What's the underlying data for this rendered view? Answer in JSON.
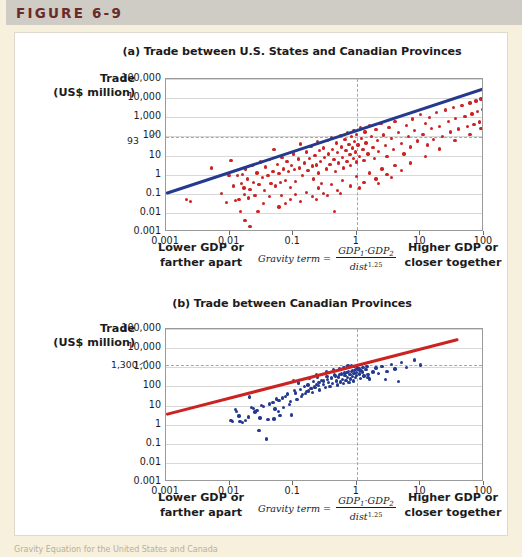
{
  "figure": {
    "label": "FIGURE 6-9",
    "bottom_caption": "Gravity Equation for the United States and Canada"
  },
  "colors": {
    "figure_label": "#6b2a2a",
    "top_band": "#cfccc6",
    "page_background": "#f6f0dc",
    "panel_background": "#ffffff",
    "panel_a_points": "#cc2222",
    "panel_a_line": "#243a8f",
    "panel_b_points": "#243a8f",
    "panel_b_line": "#cc2222",
    "gridline": "#d8d8d8",
    "dashed_guide": "#a6a6a6",
    "axis": "#9a9a9a"
  },
  "axis_titles": {
    "y_line1": "Trade",
    "y_line2": "(US$ million)"
  },
  "footer": {
    "lower_line1": "Lower GDP or",
    "lower_line2": "farther apart",
    "higher_line1": "Higher GDP or",
    "higher_line2": "closer together",
    "gravity_label": "Gravity term",
    "gravity_equals": "=",
    "gravity_num_gdp1": "GDP",
    "gravity_num_sub1": "1",
    "gravity_num_dot": "·",
    "gravity_num_gdp2": "GDP",
    "gravity_num_sub2": "2",
    "gravity_den_dist": "dist",
    "gravity_den_exp": "1.25"
  },
  "chart_data": [
    {
      "type": "scatter",
      "panel": "a",
      "title": "(a) Trade between U.S. States and Canadian Provinces",
      "xlabel": "Gravity term",
      "ylabel": "Trade (US$ million)",
      "xscale": "log",
      "yscale": "log",
      "xlim": [
        0.001,
        100
      ],
      "ylim": [
        0.001,
        100000
      ],
      "xticks": [
        "0.001",
        "0.01",
        "0.1",
        "1",
        "10",
        "100"
      ],
      "yticks": [
        "0.001",
        "0.01",
        "0.1",
        "1",
        "10",
        "100",
        "1,000",
        "10,000",
        "100,000"
      ],
      "grid": true,
      "legend": "none",
      "point_color": "#cc2222",
      "line_color": "#243a8f",
      "annotation_y_value": "93",
      "annotation_y_numeric": 93,
      "guide_vline_x": 1,
      "fit_line": {
        "x1": 0.001,
        "y1": 0.1,
        "x2": 100,
        "y2": 30000
      },
      "points": [
        [
          0.0021,
          0.05
        ],
        [
          0.0024,
          0.04
        ],
        [
          0.0052,
          2.2
        ],
        [
          0.0074,
          0.1
        ],
        [
          0.0098,
          0.9
        ],
        [
          0.0105,
          5.5
        ],
        [
          0.0115,
          0.25
        ],
        [
          0.0125,
          0.045
        ],
        [
          0.0132,
          0.9
        ],
        [
          0.014,
          0.05
        ],
        [
          0.0148,
          0.012
        ],
        [
          0.0152,
          0.34
        ],
        [
          0.016,
          1.0
        ],
        [
          0.0168,
          0.2
        ],
        [
          0.0175,
          0.004
        ],
        [
          0.018,
          2.0
        ],
        [
          0.019,
          0.6
        ],
        [
          0.02,
          0.06
        ],
        [
          0.021,
          0.16
        ],
        [
          0.0225,
          3.0
        ],
        [
          0.024,
          0.4
        ],
        [
          0.025,
          0.08
        ],
        [
          0.027,
          1.2
        ],
        [
          0.029,
          0.3
        ],
        [
          0.031,
          4.5
        ],
        [
          0.033,
          0.7
        ],
        [
          0.035,
          0.15
        ],
        [
          0.037,
          2.5
        ],
        [
          0.04,
          0.9
        ],
        [
          0.042,
          6.0
        ],
        [
          0.045,
          0.35
        ],
        [
          0.048,
          1.5
        ],
        [
          0.05,
          20
        ],
        [
          0.053,
          0.25
        ],
        [
          0.056,
          3.5
        ],
        [
          0.06,
          1.1
        ],
        [
          0.063,
          0.4
        ],
        [
          0.067,
          8.0
        ],
        [
          0.07,
          2.0
        ],
        [
          0.075,
          0.5
        ],
        [
          0.08,
          5.0
        ],
        [
          0.085,
          1.4
        ],
        [
          0.09,
          0.22
        ],
        [
          0.095,
          3.0
        ],
        [
          0.1,
          12
        ],
        [
          0.105,
          1.8
        ],
        [
          0.11,
          0.45
        ],
        [
          0.12,
          6.5
        ],
        [
          0.125,
          2.2
        ],
        [
          0.13,
          40
        ],
        [
          0.14,
          0.9
        ],
        [
          0.15,
          4.0
        ],
        [
          0.16,
          15
        ],
        [
          0.17,
          1.6
        ],
        [
          0.18,
          7.0
        ],
        [
          0.19,
          30
        ],
        [
          0.2,
          2.8
        ],
        [
          0.21,
          0.6
        ],
        [
          0.22,
          10
        ],
        [
          0.23,
          3.2
        ],
        [
          0.24,
          55
        ],
        [
          0.25,
          1.2
        ],
        [
          0.26,
          18
        ],
        [
          0.27,
          5.0
        ],
        [
          0.28,
          0.35
        ],
        [
          0.3,
          25
        ],
        [
          0.31,
          8.0
        ],
        [
          0.33,
          2.0
        ],
        [
          0.35,
          60
        ],
        [
          0.36,
          12
        ],
        [
          0.38,
          3.5
        ],
        [
          0.4,
          90
        ],
        [
          0.42,
          20
        ],
        [
          0.44,
          6.0
        ],
        [
          0.46,
          1.5
        ],
        [
          0.48,
          45
        ],
        [
          0.5,
          14
        ],
        [
          0.52,
          4.0
        ],
        [
          0.55,
          110
        ],
        [
          0.58,
          28
        ],
        [
          0.6,
          8.0
        ],
        [
          0.62,
          2.2
        ],
        [
          0.65,
          70
        ],
        [
          0.68,
          18
        ],
        [
          0.7,
          5.0
        ],
        [
          0.72,
          150
        ],
        [
          0.75,
          38
        ],
        [
          0.78,
          11
        ],
        [
          0.8,
          3.0
        ],
        [
          0.82,
          95
        ],
        [
          0.85,
          25
        ],
        [
          0.88,
          7.0
        ],
        [
          0.9,
          200
        ],
        [
          0.92,
          55
        ],
        [
          0.95,
          15
        ],
        [
          0.98,
          4.5
        ],
        [
          1.0,
          130
        ],
        [
          1.05,
          35
        ],
        [
          1.1,
          9.0
        ],
        [
          1.15,
          280
        ],
        [
          1.2,
          75
        ],
        [
          1.25,
          20
        ],
        [
          1.3,
          5.5
        ],
        [
          1.35,
          170
        ],
        [
          1.4,
          45
        ],
        [
          1.5,
          12
        ],
        [
          1.6,
          360
        ],
        [
          1.7,
          95
        ],
        [
          1.8,
          26
        ],
        [
          1.9,
          7.0
        ],
        [
          2.0,
          220
        ],
        [
          2.1,
          60
        ],
        [
          2.2,
          16
        ],
        [
          2.4,
          480
        ],
        [
          2.6,
          120
        ],
        [
          2.8,
          34
        ],
        [
          3.0,
          9.0
        ],
        [
          3.2,
          290
        ],
        [
          3.5,
          78
        ],
        [
          3.8,
          21
        ],
        [
          4.0,
          620
        ],
        [
          4.5,
          160
        ],
        [
          5.0,
          44
        ],
        [
          5.5,
          12
        ],
        [
          6.0,
          380
        ],
        [
          6.5,
          100
        ],
        [
          7.0,
          28
        ],
        [
          7.5,
          800
        ],
        [
          8.0,
          210
        ],
        [
          9.0,
          57
        ],
        [
          10,
          1400
        ],
        [
          11,
          130
        ],
        [
          12,
          480
        ],
        [
          13,
          36
        ],
        [
          14,
          1000
        ],
        [
          15,
          260
        ],
        [
          16,
          70
        ],
        [
          18,
          1800
        ],
        [
          20,
          340
        ],
        [
          22,
          95
        ],
        [
          25,
          2400
        ],
        [
          28,
          600
        ],
        [
          30,
          170
        ],
        [
          33,
          3200
        ],
        [
          36,
          880
        ],
        [
          40,
          240
        ],
        [
          45,
          4200
        ],
        [
          50,
          1100
        ],
        [
          55,
          320
        ],
        [
          60,
          5500
        ],
        [
          65,
          1500
        ],
        [
          70,
          420
        ],
        [
          75,
          7000
        ],
        [
          80,
          2000
        ],
        [
          85,
          560
        ],
        [
          90,
          9000
        ],
        [
          95,
          2600
        ],
        [
          100,
          730
        ],
        [
          0.065,
          0.08
        ],
        [
          0.075,
          0.03
        ],
        [
          0.09,
          0.05
        ],
        [
          0.11,
          0.09
        ],
        [
          0.13,
          0.04
        ],
        [
          0.16,
          0.12
        ],
        [
          0.2,
          0.07
        ],
        [
          0.25,
          0.2
        ],
        [
          0.3,
          0.1
        ],
        [
          0.4,
          0.3
        ],
        [
          0.5,
          0.15
        ],
        [
          0.6,
          0.5
        ],
        [
          0.8,
          0.25
        ],
        [
          1.0,
          0.8
        ],
        [
          1.3,
          0.4
        ],
        [
          1.6,
          1.2
        ],
        [
          2.0,
          0.6
        ],
        [
          2.5,
          2.0
        ],
        [
          3.0,
          1.0
        ],
        [
          4.0,
          3.0
        ],
        [
          5.0,
          1.6
        ],
        [
          0.45,
          0.012
        ],
        [
          0.021,
          0.002
        ],
        [
          0.009,
          0.035
        ],
        [
          0.06,
          0.02
        ],
        [
          0.042,
          0.07
        ],
        [
          0.034,
          0.03
        ],
        [
          0.028,
          0.012
        ],
        [
          0.017,
          0.09
        ],
        [
          0.23,
          0.05
        ],
        [
          0.35,
          0.08
        ],
        [
          0.55,
          0.1
        ],
        [
          1.1,
          0.2
        ],
        [
          2.2,
          0.35
        ],
        [
          3.5,
          0.7
        ],
        [
          7.0,
          4.0
        ],
        [
          12,
          9.0
        ],
        [
          20,
          22
        ],
        [
          35,
          60
        ],
        [
          60,
          130
        ],
        [
          90,
          250
        ]
      ]
    },
    {
      "type": "scatter",
      "panel": "b",
      "title": "(b) Trade between Canadian Provinces",
      "xlabel": "Gravity term",
      "ylabel": "Trade (US$ million)",
      "xscale": "log",
      "yscale": "log",
      "xlim": [
        0.001,
        100
      ],
      "ylim": [
        0.001,
        100000
      ],
      "xticks": [
        "0.001",
        "0.01",
        "0.1",
        "1",
        "10",
        "100"
      ],
      "yticks": [
        "0.001",
        "0.01",
        "0.1",
        "1",
        "10",
        "100",
        "1,000",
        "10,000",
        "100,000"
      ],
      "grid": true,
      "legend": "none",
      "point_color": "#243a8f",
      "line_color": "#cc2222",
      "annotation_y_value": "1,300",
      "annotation_y_numeric": 1300,
      "guide_vline_x": 1,
      "fit_line": {
        "x1": 0.001,
        "y1": 3.5,
        "x2": 40,
        "y2": 30000
      },
      "points": [
        [
          0.0105,
          1.6
        ],
        [
          0.0112,
          1.4
        ],
        [
          0.0125,
          6.0
        ],
        [
          0.013,
          5.0
        ],
        [
          0.0145,
          1.5
        ],
        [
          0.016,
          1.3
        ],
        [
          0.0205,
          28
        ],
        [
          0.022,
          8.0
        ],
        [
          0.024,
          7.0
        ],
        [
          0.025,
          4.5
        ],
        [
          0.027,
          5.5
        ],
        [
          0.029,
          0.5
        ],
        [
          0.032,
          10
        ],
        [
          0.034,
          9.0
        ],
        [
          0.038,
          0.18
        ],
        [
          0.042,
          12
        ],
        [
          0.048,
          14
        ],
        [
          0.055,
          22
        ],
        [
          0.06,
          18
        ],
        [
          0.062,
          3.0
        ],
        [
          0.068,
          25
        ],
        [
          0.075,
          30
        ],
        [
          0.082,
          40
        ],
        [
          0.09,
          16
        ],
        [
          0.095,
          3.2
        ],
        [
          0.1,
          200
        ],
        [
          0.105,
          60
        ],
        [
          0.11,
          45
        ],
        [
          0.12,
          150
        ],
        [
          0.13,
          70
        ],
        [
          0.14,
          38
        ],
        [
          0.15,
          95
        ],
        [
          0.16,
          55
        ],
        [
          0.17,
          120
        ],
        [
          0.18,
          260
        ],
        [
          0.19,
          80
        ],
        [
          0.2,
          48
        ],
        [
          0.21,
          180
        ],
        [
          0.22,
          90
        ],
        [
          0.24,
          300
        ],
        [
          0.25,
          110
        ],
        [
          0.26,
          65
        ],
        [
          0.28,
          210
        ],
        [
          0.3,
          130
        ],
        [
          0.32,
          85
        ],
        [
          0.34,
          340
        ],
        [
          0.36,
          160
        ],
        [
          0.38,
          100
        ],
        [
          0.4,
          250
        ],
        [
          0.42,
          140
        ],
        [
          0.45,
          400
        ],
        [
          0.48,
          190
        ],
        [
          0.5,
          120
        ],
        [
          0.52,
          310
        ],
        [
          0.55,
          170
        ],
        [
          0.58,
          450
        ],
        [
          0.6,
          230
        ],
        [
          0.62,
          140
        ],
        [
          0.65,
          380
        ],
        [
          0.68,
          200
        ],
        [
          0.7,
          520
        ],
        [
          0.72,
          280
        ],
        [
          0.75,
          160
        ],
        [
          0.78,
          420
        ],
        [
          0.8,
          240
        ],
        [
          0.82,
          620
        ],
        [
          0.85,
          330
        ],
        [
          0.88,
          190
        ],
        [
          0.9,
          480
        ],
        [
          0.92,
          700
        ],
        [
          0.95,
          290
        ],
        [
          0.98,
          540
        ],
        [
          1.0,
          380
        ],
        [
          1.05,
          820
        ],
        [
          1.1,
          450
        ],
        [
          1.15,
          260
        ],
        [
          1.2,
          640
        ],
        [
          1.3,
          350
        ],
        [
          1.4,
          750
        ],
        [
          1.5,
          420
        ],
        [
          1.6,
          240
        ],
        [
          1.8,
          560
        ],
        [
          2.0,
          900
        ],
        [
          2.2,
          480
        ],
        [
          2.5,
          1100
        ],
        [
          3.0,
          620
        ],
        [
          3.5,
          1400
        ],
        [
          4.0,
          800
        ],
        [
          5.0,
          1800
        ],
        [
          6.0,
          1000
        ],
        [
          8.0,
          2400
        ],
        [
          10,
          1300
        ],
        [
          0.052,
          6.5
        ],
        [
          0.058,
          5.0
        ],
        [
          0.07,
          8.0
        ],
        [
          0.088,
          11
        ],
        [
          0.115,
          20
        ],
        [
          0.135,
          30
        ],
        [
          0.155,
          42
        ],
        [
          0.175,
          58
        ],
        [
          0.195,
          75
        ],
        [
          0.215,
          100
        ],
        [
          0.235,
          125
        ],
        [
          0.255,
          155
        ],
        [
          0.3,
          190
        ],
        [
          0.35,
          230
        ],
        [
          0.4,
          290
        ],
        [
          0.46,
          350
        ],
        [
          0.54,
          420
        ],
        [
          0.64,
          500
        ],
        [
          0.74,
          580
        ],
        [
          0.86,
          660
        ],
        [
          0.96,
          740
        ],
        [
          1.08,
          850
        ],
        [
          1.25,
          950
        ],
        [
          1.45,
          1050
        ],
        [
          0.05,
          2.0
        ],
        [
          0.04,
          1.8
        ],
        [
          0.03,
          2.2
        ],
        [
          0.02,
          2.5
        ],
        [
          0.018,
          1.7
        ],
        [
          0.014,
          2.8
        ],
        [
          0.23,
          400
        ],
        [
          0.33,
          560
        ],
        [
          0.43,
          720
        ],
        [
          0.53,
          880
        ],
        [
          0.63,
          1000
        ],
        [
          0.73,
          1150
        ],
        [
          0.83,
          1250
        ],
        [
          0.93,
          1050
        ],
        [
          1.02,
          900
        ],
        [
          1.12,
          700
        ],
        [
          1.22,
          560
        ],
        [
          1.5,
          300
        ],
        [
          2.8,
          220
        ],
        [
          4.5,
          180
        ]
      ]
    }
  ]
}
